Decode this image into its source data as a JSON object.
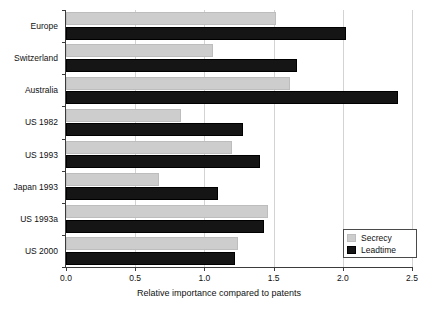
{
  "chart_data": {
    "type": "bar",
    "orientation": "horizontal",
    "title": "",
    "xlabel": "Relative importance compared to patents",
    "ylabel": "",
    "xlim": [
      0.0,
      2.5
    ],
    "xticks": [
      "0.0",
      "0.5",
      "1.0",
      "1.5",
      "2.0",
      "2.5"
    ],
    "xtick_values": [
      0.0,
      0.5,
      1.0,
      1.5,
      2.0,
      2.5
    ],
    "grid": "vertical",
    "legend_position": "bottom-right",
    "categories": [
      "Europe",
      "Switzerland",
      "Australia",
      "US 1982",
      "US 1993",
      "Japan 1993",
      "US 1993a",
      "US 2000"
    ],
    "series": [
      {
        "name": "Secrecy",
        "color": "#cdcdcd",
        "values": [
          1.52,
          1.06,
          1.62,
          0.83,
          1.2,
          0.67,
          1.46,
          1.24
        ]
      },
      {
        "name": "Leadtime",
        "color": "#151515",
        "values": [
          2.02,
          1.67,
          2.4,
          1.28,
          1.4,
          1.1,
          1.43,
          1.22
        ]
      }
    ]
  },
  "legend": {
    "entries": [
      {
        "label": "Secrecy"
      },
      {
        "label": "Leadtime"
      }
    ]
  },
  "colors": {
    "secrecy": "#cdcdcd",
    "leadtime": "#151515",
    "axis": "#3b3b3b",
    "grid": "#d3d3d3",
    "background": "#ffffff"
  }
}
